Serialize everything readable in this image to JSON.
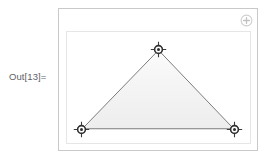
{
  "cell": {
    "output_label": "Out[13]=",
    "label_color": "#5d6166"
  },
  "graphics": {
    "outer_frame": {
      "name": "graphics-selection-frame",
      "border_color": "#c9c9c9",
      "background": "#ffffff"
    },
    "inner_frame": {
      "name": "plot-frame",
      "border_color": "#e6e6e6",
      "background": "#ffffff"
    },
    "add_button": {
      "icon": "plus-circle-icon",
      "color": "#d0d0d0"
    },
    "shape": {
      "type": "triangle",
      "fill_color": "#f4f4f4",
      "edge_color": "#5a5a5a",
      "vertices": [
        {
          "id": "apex",
          "x": 157,
          "y": 48
        },
        {
          "id": "bottom-left",
          "x": 80,
          "y": 128
        },
        {
          "id": "bottom-right",
          "x": 233,
          "y": 128
        }
      ]
    },
    "locators": [
      {
        "id": "locator-1",
        "label": "apex",
        "x": 99,
        "y": 40
      },
      {
        "id": "locator-2",
        "label": "bottom-left",
        "x": 22,
        "y": 120
      },
      {
        "id": "locator-3",
        "label": "bottom-right",
        "x": 175,
        "y": 120
      }
    ]
  }
}
